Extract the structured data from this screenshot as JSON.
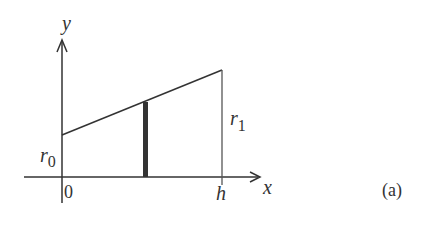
{
  "figure": {
    "label": "(a)",
    "axes": {
      "x_label": "x",
      "y_label": "y",
      "origin_label": "0"
    },
    "annotations": {
      "r0": {
        "base": "r",
        "sub": "0"
      },
      "r1": {
        "base": "r",
        "sub": "1"
      },
      "h": "h"
    },
    "geometry": {
      "description": "Linear profile from r0 at x=0 to r1 at x=h, with a thick vertical strip at an intermediate x",
      "line_color": "#333333"
    }
  }
}
